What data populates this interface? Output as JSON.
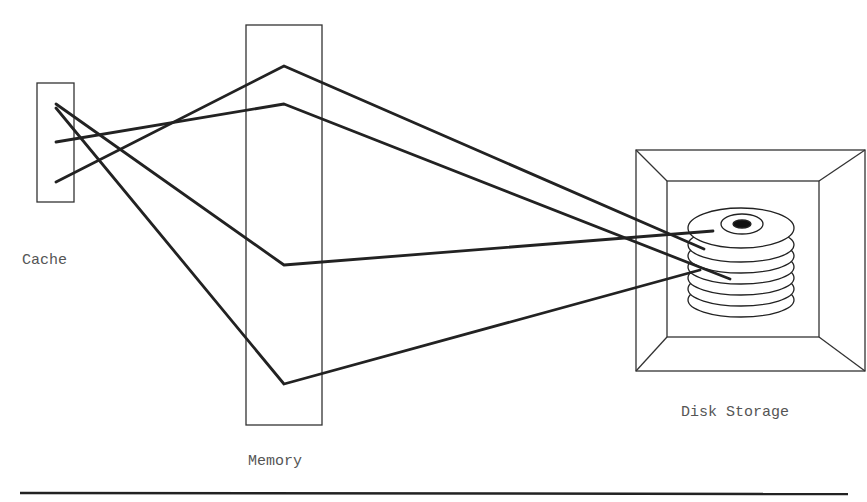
{
  "diagram": {
    "labels": {
      "cache": "Cache",
      "memory": "Memory",
      "disk": "Disk Storage"
    },
    "colors": {
      "stroke": "#222222",
      "label": "#555555",
      "background": "#ffffff"
    }
  }
}
